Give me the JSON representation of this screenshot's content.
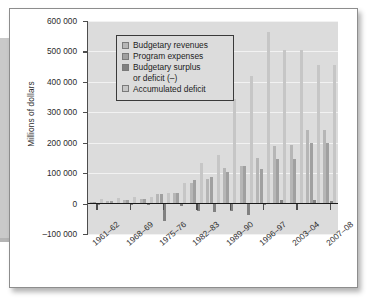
{
  "chart_data": {
    "type": "bar",
    "title": "",
    "subtitle": "",
    "xlabel": "",
    "ylabel": "Millions of dollars",
    "ylim": [
      -100000,
      600000
    ],
    "ytick_labels": [
      "600 000",
      "500 000",
      "400 000",
      "300 000",
      "200 000",
      "100 000",
      "0",
      "-100 000"
    ],
    "ytick_values": [
      600000,
      500000,
      400000,
      300000,
      200000,
      100000,
      0,
      -100000
    ],
    "grid": true,
    "legend_position": "top-left",
    "categories": [
      "1961-62",
      "1964-65",
      "1968-69",
      "1971-72",
      "1975-76",
      "1978-79",
      "1982-83",
      "1985-86",
      "1989-90",
      "1992-93",
      "1996-97",
      "1999-2000",
      "2003-04",
      "2005-06",
      "2007-08"
    ],
    "xtick_labels": [
      "1961–62",
      "1968–69",
      "1975–76",
      "1982–83",
      "1989–90",
      "1996–97",
      "2003–04",
      "2007–08"
    ],
    "series": [
      {
        "name": "Budgetary revenues",
        "color": "#b6b6b6",
        "values": [
          6000,
          8000,
          11000,
          16000,
          31000,
          35000,
          67000,
          80000,
          116000,
          122000,
          149000,
          190000,
          191000,
          241000,
          242000
        ]
      },
      {
        "name": "Program expenses",
        "color": "#a0a0a0",
        "values": [
          6000,
          8000,
          11000,
          16000,
          33000,
          35000,
          79000,
          88000,
          103000,
          122000,
          112000,
          146000,
          146000,
          198000,
          199000
        ]
      },
      {
        "name": "Budgetary surplus or deficit (–)",
        "color": "#818181",
        "values": [
          -1000,
          1000,
          -1000,
          -2000,
          -58000,
          -8000,
          -25000,
          -28000,
          -25000,
          -39000,
          -3000,
          12000,
          3000,
          13000,
          10000
        ]
      },
      {
        "name": "Accumulated deficit",
        "color": "#c6c6c6",
        "values": [
          14000,
          18000,
          20000,
          22000,
          34000,
          67000,
          134000,
          160000,
          345000,
          420000,
          563000,
          505000,
          505000,
          455000,
          455000
        ]
      }
    ]
  },
  "legend": {
    "items": [
      {
        "label": "Budgetary revenues",
        "swatch": "revenues"
      },
      {
        "label": "Program expenses",
        "swatch": "expenses"
      },
      {
        "label": "Budgetary surplus",
        "label2": "or deficit (–)",
        "swatch": "balance"
      },
      {
        "label": "Accumulated deficit",
        "swatch": "accumulated"
      }
    ],
    "item_0_label": "Budgetary revenues",
    "item_1_label": "Program expenses",
    "item_2_label": "Budgetary surplus",
    "item_2_label_line2": "or deficit (–)",
    "item_3_label": "Accumulated deficit"
  },
  "axis": {
    "y_title": "Millions of dollars",
    "y_0": "600 000",
    "y_1": "500 000",
    "y_2": "400 000",
    "y_3": "300 000",
    "y_4": "200 000",
    "y_5": "100 000",
    "y_6": "0",
    "y_7": "–100 000",
    "x_0": "1961–62",
    "x_1": "1968–69",
    "x_2": "1975–76",
    "x_3": "1982–83",
    "x_4": "1989–90",
    "x_5": "1996–97",
    "x_6": "2003–04",
    "x_7": "2007–08"
  }
}
